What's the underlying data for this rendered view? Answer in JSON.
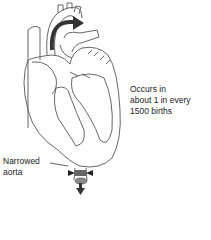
{
  "diagram": {
    "annotations": {
      "occurs": [
        "Occurs in",
        "about 1 in every",
        "1500 births"
      ],
      "narrowed_aorta": [
        "Narrowed",
        "aorta"
      ]
    },
    "colors": {
      "outline": "#555555",
      "arrow": "#333333",
      "constriction": "#666666"
    }
  }
}
